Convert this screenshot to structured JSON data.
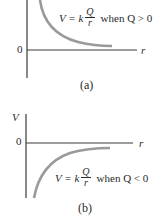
{
  "panels": [
    {
      "id": "a",
      "caption": "(a)",
      "y_axis_label": "",
      "zero_label": "0",
      "x_axis_label": "r",
      "formula": {
        "lhs": "V = k",
        "numerator": "Q",
        "denominator": "r",
        "condition": "when Q > 0"
      },
      "curve_color": "#9a9a9a"
    },
    {
      "id": "b",
      "caption": "(b)",
      "y_axis_label": "V",
      "zero_label": "0",
      "x_axis_label": "r",
      "formula": {
        "lhs": "V = k",
        "numerator": "Q",
        "denominator": "r",
        "condition": "when Q < 0"
      },
      "curve_color": "#9a9a9a"
    }
  ],
  "colors": {
    "axis": "#3a3a3a",
    "curve": "#9a9a9a",
    "text": "#2a2a2a"
  }
}
